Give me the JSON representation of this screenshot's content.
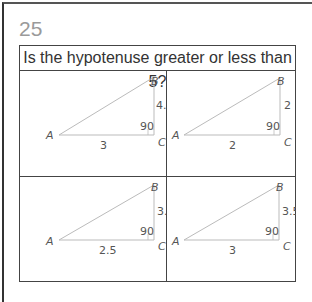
{
  "question_number": "25",
  "title": "Is the hypotenuse greater or less than 5?",
  "triangles": [
    {
      "vertex_a": "A",
      "vertex_b": "B",
      "vertex_c": "C",
      "base": "3",
      "height": "4.1",
      "angle": "90"
    },
    {
      "vertex_a": "A",
      "vertex_b": "B",
      "vertex_c": "C",
      "base": "2",
      "height": "2",
      "angle": "90"
    },
    {
      "vertex_a": "A",
      "vertex_b": "B",
      "vertex_c": "C",
      "base": "2.5",
      "height": "3.5",
      "angle": "90"
    },
    {
      "vertex_a": "A",
      "vertex_b": "B",
      "vertex_c": "C",
      "base": "3",
      "height": "3.5",
      "angle": "90"
    }
  ],
  "colors": {
    "triangle_stroke": "#bbbbbb",
    "text": "#555555",
    "border": "#444444"
  }
}
